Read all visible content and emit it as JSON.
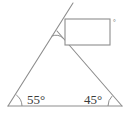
{
  "figure": {
    "type": "geometry-diagram",
    "background_color": "#ffffff",
    "stroke_color": "#8d8d8d",
    "stroke_color_dark": "#6f6f6f",
    "label_color": "#3b3b3b",
    "stroke_width": 1.1,
    "canvas": {
      "width": 129,
      "height": 113
    }
  },
  "labels": {
    "left_angle": "55°",
    "right_angle": "45°",
    "rectangle_corner_mark": "°"
  },
  "angles": {
    "left_value": 55,
    "right_value": 45,
    "apex_value": 80
  },
  "points": {
    "left_vertex": {
      "x": 8,
      "y": 106
    },
    "right_vertex": {
      "x": 122,
      "y": 106
    },
    "apex": {
      "x": 57,
      "y": 31
    },
    "ray_end": {
      "x": 73,
      "y": 3
    }
  },
  "rectangle": {
    "x": 65,
    "y": 19,
    "width": 45,
    "height": 26,
    "fill": "#ffffff",
    "stroke": "#8d8d8d"
  },
  "segments": [
    {
      "name": "baseline",
      "x1": 8,
      "y1": 106,
      "x2": 122,
      "y2": 106
    },
    {
      "name": "left-side-ray",
      "x1": 8,
      "y1": 106,
      "x2": 73,
      "y2": 3
    },
    {
      "name": "right-side",
      "x1": 57,
      "y1": 31,
      "x2": 122,
      "y2": 106
    }
  ]
}
